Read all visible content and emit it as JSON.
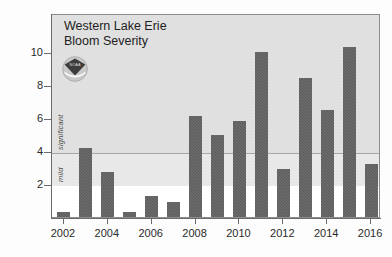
{
  "chart_data": {
    "type": "bar",
    "title": "Western Lake Erie\nBloom Severity",
    "xlabel": "",
    "ylabel": "",
    "categories": [
      2002,
      2003,
      2004,
      2005,
      2006,
      2007,
      2008,
      2009,
      2010,
      2011,
      2012,
      2013,
      2014,
      2015,
      2016
    ],
    "values": [
      0.3,
      4.2,
      2.7,
      0.3,
      1.3,
      0.9,
      6.1,
      5.0,
      5.8,
      10.0,
      2.9,
      8.4,
      6.5,
      10.3,
      3.2
    ],
    "x_tick_labels": [
      "2002",
      "2004",
      "2006",
      "2008",
      "2010",
      "2012",
      "2014",
      "2016"
    ],
    "y_tick_labels": [
      "2",
      "4",
      "6",
      "8",
      "10"
    ],
    "y_ticks": [
      2,
      4,
      6,
      8,
      10
    ],
    "ylim": [
      0,
      11.2
    ],
    "grid": true,
    "gridlines_at": [
      4
    ],
    "legend": "none",
    "annotations": [
      {
        "text": "significant",
        "orientation": "vertical",
        "range": [
          4,
          8
        ]
      },
      {
        "text": "mild",
        "orientation": "vertical",
        "range": [
          2,
          4
        ]
      }
    ],
    "bands": [
      {
        "label": "mild",
        "from": 2,
        "to": 4,
        "color": "#e8e8e8"
      },
      {
        "label": "significant",
        "from": 4,
        "to": 11.2,
        "color": "#e0e0e0"
      }
    ],
    "bar_color": "#5a5a5a",
    "background_color": "#ffffff"
  },
  "logo": {
    "name": "noaa-logo",
    "alt": "NOAA emblem"
  }
}
